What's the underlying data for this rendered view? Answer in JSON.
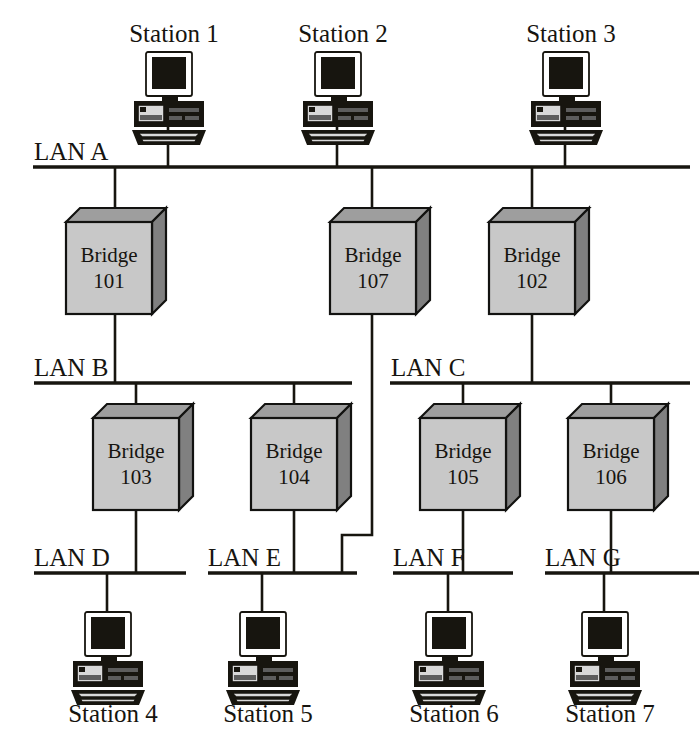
{
  "diagram": {
    "colors": {
      "box_face": "#c8c8c8",
      "box_top": "#9e9e9e",
      "box_side": "#808080",
      "line": "#17150f",
      "background": "#ffffff"
    },
    "lans": [
      {
        "id": "lan-a",
        "label": "LAN A",
        "label_x": 34,
        "label_y": 160,
        "bus_x1": 33,
        "bus_x2": 690,
        "bus_y": 167
      },
      {
        "id": "lan-b",
        "label": "LAN B",
        "label_x": 34,
        "label_y": 376,
        "bus_x1": 34,
        "bus_x2": 352,
        "bus_y": 383
      },
      {
        "id": "lan-c",
        "label": "LAN C",
        "label_x": 391,
        "label_y": 376,
        "bus_x1": 390,
        "bus_x2": 690,
        "bus_y": 383
      },
      {
        "id": "lan-d",
        "label": "LAN D",
        "label_x": 34,
        "label_y": 566,
        "bus_x1": 34,
        "bus_x2": 186,
        "bus_y": 573
      },
      {
        "id": "lan-e",
        "label": "LAN E",
        "label_x": 208,
        "label_y": 566,
        "bus_x1": 208,
        "bus_x2": 357,
        "bus_y": 573
      },
      {
        "id": "lan-f",
        "label": "LAN F",
        "label_x": 393,
        "label_y": 566,
        "bus_x1": 393,
        "bus_x2": 513,
        "bus_y": 573
      },
      {
        "id": "lan-g",
        "label": "LAN G",
        "label_x": 545,
        "label_y": 566,
        "bus_x1": 545,
        "bus_x2": 699,
        "bus_y": 573
      }
    ],
    "stations": [
      {
        "id": "station-1",
        "label": "Station 1",
        "icon": "desktop-computer-icon",
        "icon_x": 132,
        "icon_y": 52,
        "label_x": 174,
        "label_y": 42,
        "stem_x": 168,
        "stem_y1": 124,
        "stem_y2": 167
      },
      {
        "id": "station-2",
        "label": "Station 2",
        "icon": "desktop-computer-icon",
        "icon_x": 301,
        "icon_y": 52,
        "label_x": 343,
        "label_y": 42,
        "stem_x": 337,
        "stem_y1": 124,
        "stem_y2": 167
      },
      {
        "id": "station-3",
        "label": "Station 3",
        "icon": "desktop-computer-icon",
        "icon_x": 529,
        "icon_y": 52,
        "label_x": 571,
        "label_y": 42,
        "stem_x": 565,
        "stem_y1": 124,
        "stem_y2": 167
      },
      {
        "id": "station-4",
        "label": "Station 4",
        "icon": "desktop-computer-icon",
        "icon_x": 71,
        "icon_y": 612,
        "label_x": 113,
        "label_y": 722,
        "stem_x": 107,
        "stem_y1": 573,
        "stem_y2": 614
      },
      {
        "id": "station-5",
        "label": "Station 5",
        "icon": "desktop-computer-icon",
        "icon_x": 226,
        "icon_y": 612,
        "label_x": 268,
        "label_y": 722,
        "stem_x": 262,
        "stem_y1": 573,
        "stem_y2": 614
      },
      {
        "id": "station-6",
        "label": "Station 6",
        "icon": "desktop-computer-icon",
        "icon_x": 412,
        "icon_y": 612,
        "label_x": 454,
        "label_y": 722,
        "stem_x": 448,
        "stem_y1": 573,
        "stem_y2": 614
      },
      {
        "id": "station-7",
        "label": "Station 7",
        "icon": "desktop-computer-icon",
        "icon_x": 568,
        "icon_y": 612,
        "label_x": 610,
        "label_y": 722,
        "stem_x": 604,
        "stem_y1": 573,
        "stem_y2": 614
      }
    ],
    "bridges": [
      {
        "id": "bridge-101",
        "name": "Bridge",
        "number": "101",
        "x": 66,
        "y": 222,
        "w": 86,
        "h": 92,
        "depth": 14,
        "uplink_x": 115,
        "uplink_y1": 167,
        "uplink_y2": 222,
        "downlink_x": 115,
        "downlink_y1": 314,
        "downlink_y2": 383
      },
      {
        "id": "bridge-107",
        "name": "Bridge",
        "number": "107",
        "x": 330,
        "y": 222,
        "w": 86,
        "h": 92,
        "depth": 14,
        "uplink_x": 372,
        "uplink_y1": 167,
        "uplink_y2": 222,
        "downlink_x": 372,
        "downlink_y1": 314,
        "downlink_y2": 535
      },
      {
        "id": "bridge-102",
        "name": "Bridge",
        "number": "102",
        "x": 489,
        "y": 222,
        "w": 86,
        "h": 92,
        "depth": 14,
        "uplink_x": 532,
        "uplink_y1": 167,
        "uplink_y2": 222,
        "downlink_x": 532,
        "downlink_y1": 314,
        "downlink_y2": 383
      },
      {
        "id": "bridge-103",
        "name": "Bridge",
        "number": "103",
        "x": 93,
        "y": 418,
        "w": 86,
        "h": 92,
        "depth": 14,
        "uplink_x": 136,
        "uplink_y1": 383,
        "uplink_y2": 418,
        "downlink_x": 136,
        "downlink_y1": 510,
        "downlink_y2": 573
      },
      {
        "id": "bridge-104",
        "name": "Bridge",
        "number": "104",
        "x": 251,
        "y": 418,
        "w": 86,
        "h": 92,
        "depth": 14,
        "uplink_x": 294,
        "uplink_y1": 383,
        "uplink_y2": 418,
        "downlink_x": 294,
        "downlink_y1": 510,
        "downlink_y2": 573
      },
      {
        "id": "bridge-105",
        "name": "Bridge",
        "number": "105",
        "x": 420,
        "y": 418,
        "w": 86,
        "h": 92,
        "depth": 14,
        "uplink_x": 463,
        "uplink_y1": 383,
        "uplink_y2": 418,
        "downlink_x": 463,
        "downlink_y1": 510,
        "downlink_y2": 573
      },
      {
        "id": "bridge-106",
        "name": "Bridge",
        "number": "106",
        "x": 568,
        "y": 418,
        "w": 86,
        "h": 92,
        "depth": 14,
        "uplink_x": 611,
        "uplink_y1": 383,
        "uplink_y2": 418,
        "downlink_x": 611,
        "downlink_y1": 510,
        "downlink_y2": 573
      }
    ],
    "routed_link": {
      "id": "bridge-107-to-lan-e",
      "description": "Bridge 107 down-link jogs left into LAN E",
      "points": "372,314 372,535 342,535 342,573"
    }
  }
}
